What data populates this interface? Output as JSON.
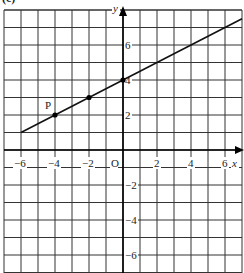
{
  "figure": {
    "header_fragment": "(c)",
    "axes": {
      "x_label": "x",
      "y_label": "y",
      "origin_label": "O",
      "x_ticks": [
        {
          "value": -6,
          "label": "−6"
        },
        {
          "value": -4,
          "label": "−4"
        },
        {
          "value": -2,
          "label": "−2"
        },
        {
          "value": 2,
          "label": "2"
        },
        {
          "value": 4,
          "label": "4"
        },
        {
          "value": 6,
          "label": "6"
        }
      ],
      "y_ticks": [
        {
          "value": 6,
          "label": "6"
        },
        {
          "value": 4,
          "label": "4"
        },
        {
          "value": 2,
          "label": "2"
        },
        {
          "value": -2,
          "label": "−2"
        },
        {
          "value": -4,
          "label": "−4"
        },
        {
          "value": -6,
          "label": "−6"
        }
      ],
      "x_range": [
        -7,
        7
      ],
      "y_range": [
        -7,
        8
      ],
      "grid_step": 1
    },
    "line": {
      "equation": "y = 0.5x + 4",
      "start": {
        "x": -6,
        "y": 1
      },
      "end": {
        "x": 7,
        "y": 7.5
      }
    },
    "points": [
      {
        "label": "P",
        "x": -4,
        "y": 2
      },
      {
        "label": "",
        "x": -2,
        "y": 3
      },
      {
        "label": "",
        "x": 0,
        "y": 4
      }
    ],
    "colors": {
      "grid": "#333333",
      "line": "#111111",
      "background": "#ffffff"
    }
  }
}
